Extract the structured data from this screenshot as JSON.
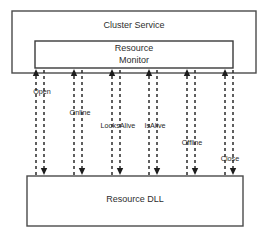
{
  "diagram": {
    "colors": {
      "background": "#ffffff",
      "box_stroke": "#4a4a4a",
      "arrow": "#1d1d1d",
      "text": "#2e2e2e"
    },
    "boxes": {
      "cluster_service": {
        "label": "Cluster Service",
        "x": 12,
        "y": 11,
        "w": 244,
        "h": 62,
        "label_x": 134,
        "label_y": 26
      },
      "resource_monitor": {
        "line1": "Resource",
        "line2": "Monitor",
        "x": 35,
        "y": 41,
        "w": 198,
        "h": 27,
        "label_x": 134,
        "line1_y": 49,
        "line2_y": 61
      },
      "resource_dll": {
        "label": "Resource DLL",
        "x": 27,
        "y": 176,
        "w": 216,
        "h": 50,
        "label_x": 135,
        "label_y": 200
      }
    },
    "entry_points": [
      {
        "label": "Open",
        "x": 40,
        "label_x": 42,
        "label_y": 92
      },
      {
        "label": "Online",
        "x": 78,
        "label_x": 80,
        "label_y": 113
      },
      {
        "label": "LooksAlive",
        "x": 116,
        "label_x": 118,
        "label_y": 126
      },
      {
        "label": "IsAlive",
        "x": 153,
        "label_x": 155,
        "label_y": 126
      },
      {
        "label": "Offline",
        "x": 191,
        "label_x": 192,
        "label_y": 143
      },
      {
        "label": "Close",
        "x": 229,
        "label_x": 230,
        "label_y": 159
      }
    ],
    "arrows": {
      "up_tip_y": 69,
      "up_tail_y": 175,
      "down_tip_y": 175,
      "down_tail_y": 70,
      "up_offset_x": -4,
      "down_offset_x": 4
    }
  }
}
